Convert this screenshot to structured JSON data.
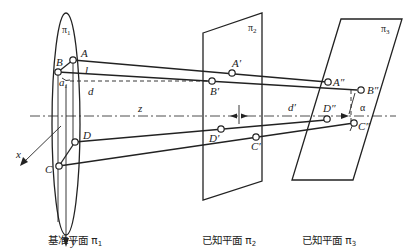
{
  "planes": {
    "pi1": {
      "label": "π",
      "sub": "1",
      "caption": "基准平面 π₁"
    },
    "pi2": {
      "label": "π",
      "sub": "2",
      "caption": "已知平面 π₂"
    },
    "pi3": {
      "label": "π",
      "sub": "3",
      "caption": "已知平面 π₃"
    }
  },
  "points": {
    "A": "A",
    "B": "B",
    "C": "C",
    "D": "D",
    "A1": "A′",
    "B1": "B′",
    "C1": "C′",
    "D1": "D′",
    "A2": "A″",
    "B2": "B″",
    "C2": "C″",
    "D2": "D″"
  },
  "dimensions": {
    "l": "l",
    "d": "d",
    "z": "z",
    "d_prime": "d′",
    "alpha": "α",
    "a1": "a",
    "a1_sub": "1"
  },
  "axes": {
    "x": "x",
    "y": "y"
  },
  "captions": {
    "pi1": "基准平面 π",
    "pi1_sub": "1",
    "pi2": "已知平面 π",
    "pi2_sub": "2",
    "pi3": "已知平面 π",
    "pi3_sub": "3"
  }
}
